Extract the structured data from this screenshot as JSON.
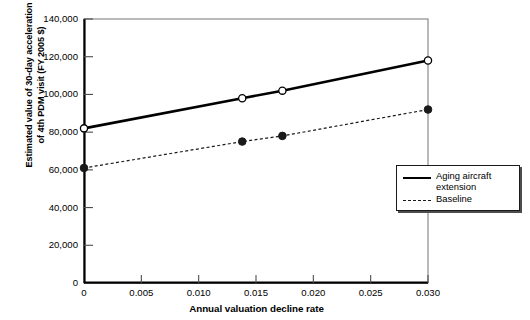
{
  "chart_data": {
    "type": "line",
    "title": "",
    "xlabel": "Annual valuation decline rate",
    "ylabel": "Estimated value of 30-day acceleration\nof 4th PDM visit (FY 2005 $)",
    "xlim": [
      0,
      0.03
    ],
    "ylim": [
      0,
      140000
    ],
    "grid": false,
    "legend_position": "right-middle-outside",
    "xticks": [
      0,
      0.005,
      0.01,
      0.015,
      0.02,
      0.025,
      0.03
    ],
    "xtick_labels": [
      "0",
      "0.005",
      "0.010",
      "0.015",
      "0.020",
      "0.025",
      "0.030"
    ],
    "yticks": [
      0,
      20000,
      40000,
      60000,
      80000,
      100000,
      120000,
      140000
    ],
    "ytick_labels": [
      "0",
      "20,000",
      "40,000",
      "60,000",
      "80,000",
      "100,000",
      "120,000",
      "140,000"
    ],
    "series": [
      {
        "name": "Aging aircraft extension",
        "linestyle": "solid",
        "marker": "open-circle",
        "color": "#000000",
        "x": [
          0,
          0.0138,
          0.0173,
          0.03
        ],
        "values": [
          82000,
          98000,
          102000,
          118000
        ]
      },
      {
        "name": "Baseline",
        "linestyle": "dashed",
        "marker": "filled-circle",
        "color": "#1a1a1a",
        "x": [
          0,
          0.0138,
          0.0173,
          0.03
        ],
        "values": [
          61000,
          75000,
          78000,
          92000
        ]
      }
    ]
  },
  "legend": {
    "entries": [
      {
        "label": "Aging aircraft extension",
        "style": "solid"
      },
      {
        "label": "Baseline",
        "style": "dashed"
      }
    ]
  }
}
